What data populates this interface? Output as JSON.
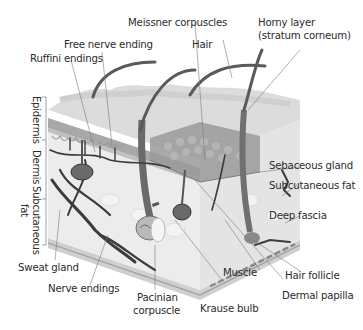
{
  "diagram": {
    "labels": {
      "meissner": "Meissner corpuscles",
      "horny_layer_1": "Horny layer",
      "horny_layer_2": "(stratum corneum)",
      "free_nerve": "Free nerve ending",
      "hair": "Hair",
      "ruffini": "Ruffini endings",
      "sebaceous": "Sebaceous gland",
      "subcut_fat": "Subcutaneous fat",
      "deep_fascia": "Deep fascia",
      "sweat_gland": "Sweat gland",
      "muscle": "Muscle",
      "hair_follicle": "Hair follicle",
      "nerve_endings": "Nerve endings",
      "dermal_papilla": "Dermal papilla",
      "pacinian_1": "Pacinian",
      "pacinian_2": "corpuscle",
      "krause": "Krause bulb"
    },
    "layers": {
      "epidermis": "Epidermis",
      "dermis": "Dermis",
      "subcutaneous": "Subcutaneous",
      "fat": "fat"
    },
    "colors": {
      "epidermis_top": "#d9d9d9",
      "epidermis_band": "#9a9a9a",
      "dermis": "#e6e6e6",
      "subcut": "#eeeeee",
      "hair": "#555555",
      "vessel": "#3a3a3a",
      "leader": "#7a7a7a"
    }
  }
}
